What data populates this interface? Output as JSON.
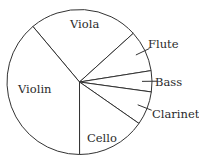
{
  "chart_data": {
    "type": "pie",
    "title": "",
    "start_angle_deg": -40,
    "direction": "clockwise",
    "categories": [
      "Viola",
      "Flute",
      "Bass",
      "Clarinet",
      "Cello",
      "Violin"
    ],
    "values": [
      24.4,
      9.2,
      4.7,
      7.5,
      15.3,
      38.9
    ],
    "labels": {
      "Viola": {
        "text": "Viola",
        "position": "inside"
      },
      "Flute": {
        "text": "Flute",
        "position": "outside-with-leader"
      },
      "Bass": {
        "text": "Bass",
        "position": "outside-with-leader"
      },
      "Clarinet": {
        "text": "Clarinet",
        "position": "outside-with-leader"
      },
      "Cello": {
        "text": "Cello",
        "position": "inside"
      },
      "Violin": {
        "text": "Violin",
        "position": "inside"
      }
    },
    "legend": "none",
    "fill": "#ffffff",
    "stroke": "#333333"
  }
}
